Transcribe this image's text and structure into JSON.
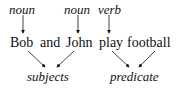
{
  "diagram": {
    "labels_top": [
      {
        "text": "noun",
        "target": "Bob"
      },
      {
        "text": "noun",
        "target": "John"
      },
      {
        "text": "verb",
        "target": "play"
      }
    ],
    "sentence": [
      "Bob",
      "and",
      "John",
      "play",
      "football"
    ],
    "labels_bottom": [
      {
        "text": "subjects",
        "sources": [
          "Bob",
          "John"
        ]
      },
      {
        "text": "predicate",
        "sources": [
          "play",
          "football"
        ]
      }
    ]
  }
}
